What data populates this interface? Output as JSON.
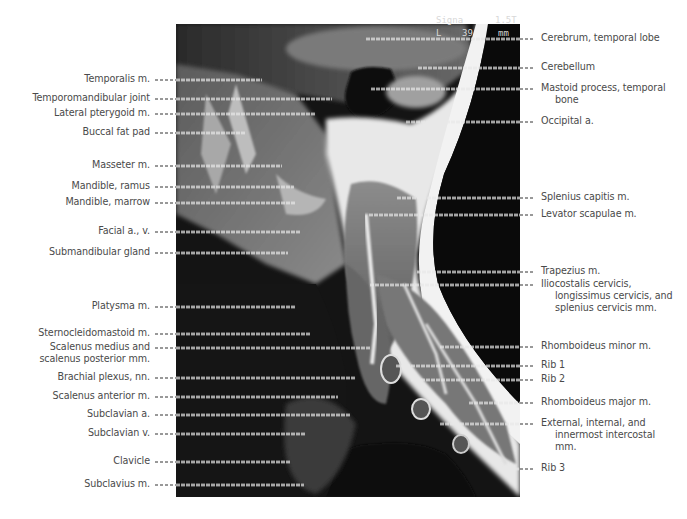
{
  "figure": {
    "type": "sagittal MRI of neck and upper thorax (annotated)",
    "image_overlay": {
      "line1": "Signa",
      "line1_right": "1.5T",
      "line2": "L",
      "line2_value": "39",
      "line2_unit": "mm"
    },
    "colors": {
      "background": "#ffffff",
      "label_text": "#4a4a4a",
      "leader_line": "#222222",
      "leader_line_on_image": "#e6e6e6"
    }
  },
  "labels_left": [
    {
      "id": "temporalis",
      "text": "Temporalis m.",
      "y": 80,
      "x_end": 262
    },
    {
      "id": "tmj",
      "text": "Temporomandibular joint",
      "y": 99,
      "x_end": 332
    },
    {
      "id": "lateral-pterygoid",
      "text": "Lateral pterygoid m.",
      "y": 114,
      "x_end": 316
    },
    {
      "id": "buccal-fat-pad",
      "text": "Buccal fat pad",
      "y": 133,
      "x_end": 246
    },
    {
      "id": "masseter",
      "text": "Masseter m.",
      "y": 166,
      "x_end": 282
    },
    {
      "id": "mandible-ramus",
      "text": "Mandible, ramus",
      "y": 187,
      "x_end": 294
    },
    {
      "id": "mandible-marrow",
      "text": "Mandible, marrow",
      "y": 203,
      "x_end": 295
    },
    {
      "id": "facial-av",
      "text": "Facial a., v.",
      "y": 232,
      "x_end": 300
    },
    {
      "id": "submandibular-gland",
      "text": "Submandibular gland",
      "y": 253,
      "x_end": 288
    },
    {
      "id": "platysma",
      "text": "Platysma m.",
      "y": 307,
      "x_end": 295
    },
    {
      "id": "sternocleidomastoid",
      "text": "Sternocleidomastoid m.",
      "y": 334,
      "x_end": 310
    },
    {
      "id": "scalenus-medius-posterior",
      "text": "Scalenus medius and",
      "text2": "scalenus posterior mm.",
      "y": 348,
      "x_end": 370
    },
    {
      "id": "brachial-plexus",
      "text": "Brachial plexus, nn.",
      "y": 378,
      "x_end": 355
    },
    {
      "id": "scalenus-anterior",
      "text": "Scalenus anterior m.",
      "y": 397,
      "x_end": 338
    },
    {
      "id": "subclavian-a",
      "text": "Subclavian a.",
      "y": 415,
      "x_end": 351
    },
    {
      "id": "subclavian-v",
      "text": "Subclavian v.",
      "y": 434,
      "x_end": 306
    },
    {
      "id": "clavicle",
      "text": "Clavicle",
      "y": 462,
      "x_end": 290
    },
    {
      "id": "subclavius",
      "text": "Subclavius m.",
      "y": 485,
      "x_end": 304
    }
  ],
  "labels_right": [
    {
      "id": "cerebrum-temporal-lobe",
      "text": "Cerebrum, temporal lobe",
      "y": 39,
      "x_start": 366
    },
    {
      "id": "cerebellum",
      "text": "Cerebellum",
      "y": 68,
      "x_start": 418
    },
    {
      "id": "mastoid-process",
      "text": "Mastoid process, temporal",
      "text2": "bone",
      "y": 89,
      "x_start": 371
    },
    {
      "id": "occipital-a",
      "text": "Occipital a.",
      "y": 122,
      "x_start": 406
    },
    {
      "id": "splenius-capitis",
      "text": "Splenius capitis m.",
      "y": 198,
      "x_start": 397
    },
    {
      "id": "levator-scapulae",
      "text": "Levator scapulae m.",
      "y": 215,
      "x_start": 369
    },
    {
      "id": "trapezius",
      "text": "Trapezius m.",
      "y": 272,
      "x_start": 417
    },
    {
      "id": "iliocostalis-cervicis",
      "text": "Iliocostalis cervicis,",
      "text2": "longissimus cervicis, and",
      "text3": "splenius cervicis mm.",
      "y": 285,
      "x_start": 370
    },
    {
      "id": "rhomboideus-minor",
      "text": "Rhomboideus minor m.",
      "y": 347,
      "x_start": 440
    },
    {
      "id": "rib-1",
      "text": "Rib 1",
      "y": 366,
      "x_start": 396
    },
    {
      "id": "rib-2",
      "text": "Rib 2",
      "y": 380,
      "x_start": 411
    },
    {
      "id": "rhomboideus-major",
      "text": "Rhomboideus major m.",
      "y": 403,
      "x_start": 469
    },
    {
      "id": "intercostal",
      "text": "External, internal, and",
      "text2": "innermost intercostal",
      "text3": "mm.",
      "y": 424,
      "x_start": 440
    },
    {
      "id": "rib-3",
      "text": "Rib 3",
      "y": 469,
      "x_start": 500
    }
  ]
}
